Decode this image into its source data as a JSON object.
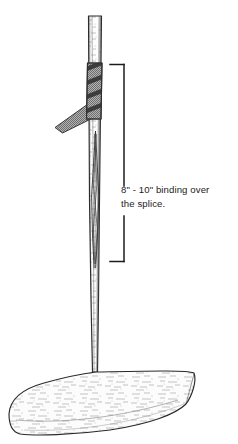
{
  "figure": {
    "kind": "technical-line-drawing",
    "background_color": "#ffffff",
    "ink_color": "#1c1c1c"
  },
  "annotation": {
    "label": "8\" - 10\" binding over\nthe splice.",
    "line_1": "8\" - 10\" binding over",
    "line_2": "the splice.",
    "measure_min": "8\"",
    "measure_max": "10\""
  },
  "dimension_bracket": {
    "orientation": "vertical",
    "top_y": 64,
    "bottom_y": 262,
    "line_x": 124,
    "tick_length": 15,
    "gap_top_y": 186,
    "gap_bottom_y": 216,
    "color": "#1c1c1c"
  },
  "parts": {
    "shaft": {
      "name": "paddle-shaft",
      "fill": "#fdfdfd",
      "stroke": "#2a2a2a",
      "texture": "wood-grain-speckle"
    },
    "binding": {
      "name": "binding-wrap",
      "fill": "#a6a6a6",
      "stroke": "#3a3a3a",
      "stripes": 4,
      "stripe_color": "#3c3c3c",
      "tail_fill": "#9a9a9a"
    },
    "splice": {
      "name": "scarf-splice-joint",
      "stroke": "#2a2a2a",
      "shape": "elongated-x"
    },
    "blade": {
      "name": "paddle-blade",
      "fill": "#fcfcfc",
      "stroke": "#2a2a2a",
      "texture": "wood-grain-speckle"
    }
  }
}
